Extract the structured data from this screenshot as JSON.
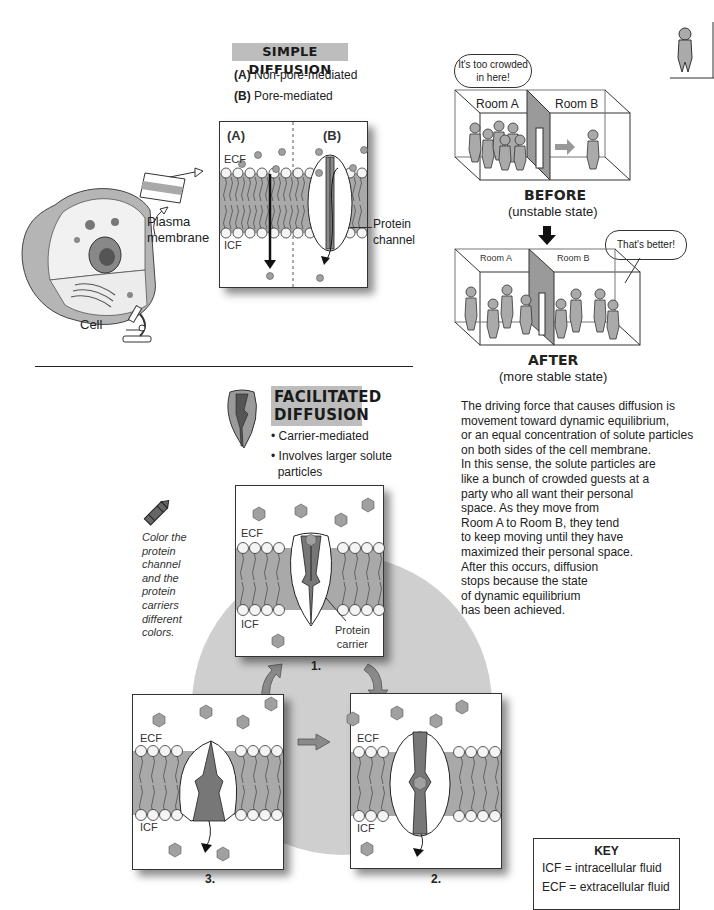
{
  "simple_diffusion": {
    "title": "SIMPLE DIFFUSION",
    "option_a_letter": "(A)",
    "option_a_text": "Non-pore-mediated",
    "option_b_letter": "(B)",
    "option_b_text": "Pore-mediated",
    "panel_label_a": "(A)",
    "panel_label_b": "(B)",
    "ecf": "ECF",
    "icf": "ICF",
    "protein_channel_label_1": "Protein",
    "protein_channel_label_2": "channel"
  },
  "cell": {
    "plasma_label_1": "Plasma",
    "plasma_label_2": "membrane",
    "cell_label": "Cell"
  },
  "rooms": {
    "thought_bubble": [
      "It's too crowded",
      "in here!"
    ],
    "room_a": "Room A",
    "room_b": "Room B",
    "before_title": "BEFORE",
    "before_sub": "(unstable state)",
    "speech_bubble": "That's better!",
    "after_room_a": "Room A",
    "after_room_b": "Room B",
    "after_title": "AFTER",
    "after_sub": "(more stable state)"
  },
  "explanation": {
    "lines": [
      "The driving force that causes diffusion is",
      "movement toward dynamic equilibrium,",
      "or an equal concentration of solute particles",
      "on both sides of the cell membrane.",
      "In this sense, the solute particles are",
      "like a bunch of crowded guests at a",
      "party who all want their personal",
      "space. As they move from",
      "Room A to Room B, they tend",
      "to keep moving until they have",
      "maximized their personal space.",
      "After this occurs, diffusion",
      "stops because the state",
      "of dynamic equilibrium",
      "has been achieved."
    ]
  },
  "facilitated_diffusion": {
    "title_1": "FACILITATED",
    "title_2": "DIFFUSION",
    "bullet_1": "Carrier-mediated",
    "bullet_2a": "Involves larger solute",
    "bullet_2b": "particles",
    "color_note": [
      "Color the",
      "protein",
      "channel",
      "and the",
      "protein",
      "carriers",
      "different",
      "colors."
    ],
    "panels": [
      {
        "step": "1.",
        "ecf": "ECF",
        "icf": "ICF",
        "carrier_label_1": "Protein",
        "carrier_label_2": "carrier"
      },
      {
        "step": "2.",
        "ecf": "ECF",
        "icf": "ICF"
      },
      {
        "step": "3.",
        "ecf": "ECF",
        "icf": "ICF"
      }
    ]
  },
  "key": {
    "title": "KEY",
    "icf_line": "ICF = intracellular fluid",
    "ecf_line": "ECF = extracellular fluid"
  },
  "colors": {
    "banner_gray": "#bdbdbd",
    "membrane_gray": "#a9a9a9",
    "particle_gray": "#9a9a9a",
    "cycle_circle": "#cfcfcf"
  }
}
